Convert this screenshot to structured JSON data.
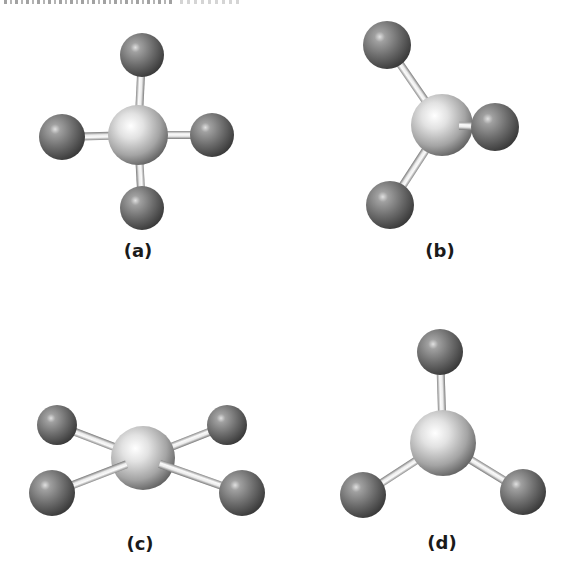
{
  "figure": {
    "colors": {
      "central_atom_light": "#f4f4f4",
      "central_atom_dark": "#6a6a6a",
      "outer_atom_light": "#c8c8c8",
      "outer_atom_dark": "#3e3e3e",
      "bond_light": "#fafafa",
      "bond_dark": "#8a8a8a",
      "label": "#1a1a1a"
    },
    "panels": [
      {
        "id": "a",
        "label": "(a)",
        "label_pos": [
          138,
          250
        ],
        "center": {
          "x": 138,
          "y": 135,
          "r": 30
        },
        "outer": [
          {
            "x": 142,
            "y": 55,
            "r": 22,
            "front": false
          },
          {
            "x": 62,
            "y": 137,
            "r": 23,
            "front": false
          },
          {
            "x": 212,
            "y": 135,
            "r": 22,
            "front": false
          },
          {
            "x": 142,
            "y": 208,
            "r": 22,
            "front": false
          }
        ]
      },
      {
        "id": "b",
        "label": "(b)",
        "label_pos": [
          440,
          250
        ],
        "center": {
          "x": 442,
          "y": 125,
          "r": 31
        },
        "outer": [
          {
            "x": 387,
            "y": 45,
            "r": 24,
            "front": false
          },
          {
            "x": 495,
            "y": 127,
            "r": 24,
            "front": true
          },
          {
            "x": 390,
            "y": 205,
            "r": 24,
            "front": false
          }
        ]
      },
      {
        "id": "c",
        "label": "(c)",
        "label_pos": [
          140,
          543
        ],
        "center": {
          "x": 143,
          "y": 458,
          "r": 32
        },
        "outer": [
          {
            "x": 57,
            "y": 425,
            "r": 20,
            "front": false
          },
          {
            "x": 227,
            "y": 425,
            "r": 20,
            "front": false
          },
          {
            "x": 52,
            "y": 493,
            "r": 23,
            "front": true
          },
          {
            "x": 242,
            "y": 493,
            "r": 23,
            "front": true
          }
        ]
      },
      {
        "id": "d",
        "label": "(d)",
        "label_pos": [
          442,
          542
        ],
        "center": {
          "x": 443,
          "y": 443,
          "r": 33
        },
        "outer": [
          {
            "x": 440,
            "y": 352,
            "r": 23,
            "front": false
          },
          {
            "x": 363,
            "y": 495,
            "r": 23,
            "front": false
          },
          {
            "x": 523,
            "y": 492,
            "r": 23,
            "front": false
          }
        ]
      }
    ]
  }
}
